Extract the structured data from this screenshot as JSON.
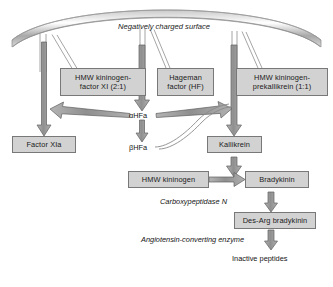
{
  "diagram": {
    "surface": {
      "label": "Negatively charged surface"
    },
    "nodes": [
      {
        "id": "hmwk-fxi",
        "lines": [
          "HMW kininogen-",
          "factor XI (2:1)"
        ]
      },
      {
        "id": "hageman",
        "lines": [
          "Hageman",
          "factor (HF)"
        ]
      },
      {
        "id": "hmwk-prekal",
        "lines": [
          "HMW kininogen-",
          "prekallikrein (1:1)"
        ]
      },
      {
        "id": "factor-xia",
        "lines": [
          "Factor XIa"
        ]
      },
      {
        "id": "kallikrein",
        "lines": [
          "Kallikrein"
        ]
      },
      {
        "id": "hmw-kininogen",
        "lines": [
          "HMW kininogen"
        ]
      },
      {
        "id": "bradykinin",
        "lines": [
          "Bradykinin"
        ]
      },
      {
        "id": "des-arg",
        "lines": [
          "Des-Arg bradykinin"
        ]
      }
    ],
    "labels": [
      {
        "id": "alpha-hfa",
        "text": "αHFa",
        "italic": false
      },
      {
        "id": "beta-hfa",
        "text": "βHFa",
        "italic": false
      },
      {
        "id": "carboxypeptidase-n",
        "text": "Carboxypeptidase N",
        "italic": true
      },
      {
        "id": "ace",
        "text": "Angiotensin-converting enzyme",
        "italic": true
      },
      {
        "id": "inactive-peptides",
        "text": "Inactive peptides",
        "italic": false
      }
    ],
    "colors": {
      "node_fill": "#d2d2d2",
      "node_border": "#787878",
      "arrow_fill": "#9a9a9a",
      "arrow_stroke": "#5a5a5a",
      "surface_stroke": "#8a8a8a",
      "text": "#1a1a1a",
      "background": "#ffffff"
    }
  }
}
